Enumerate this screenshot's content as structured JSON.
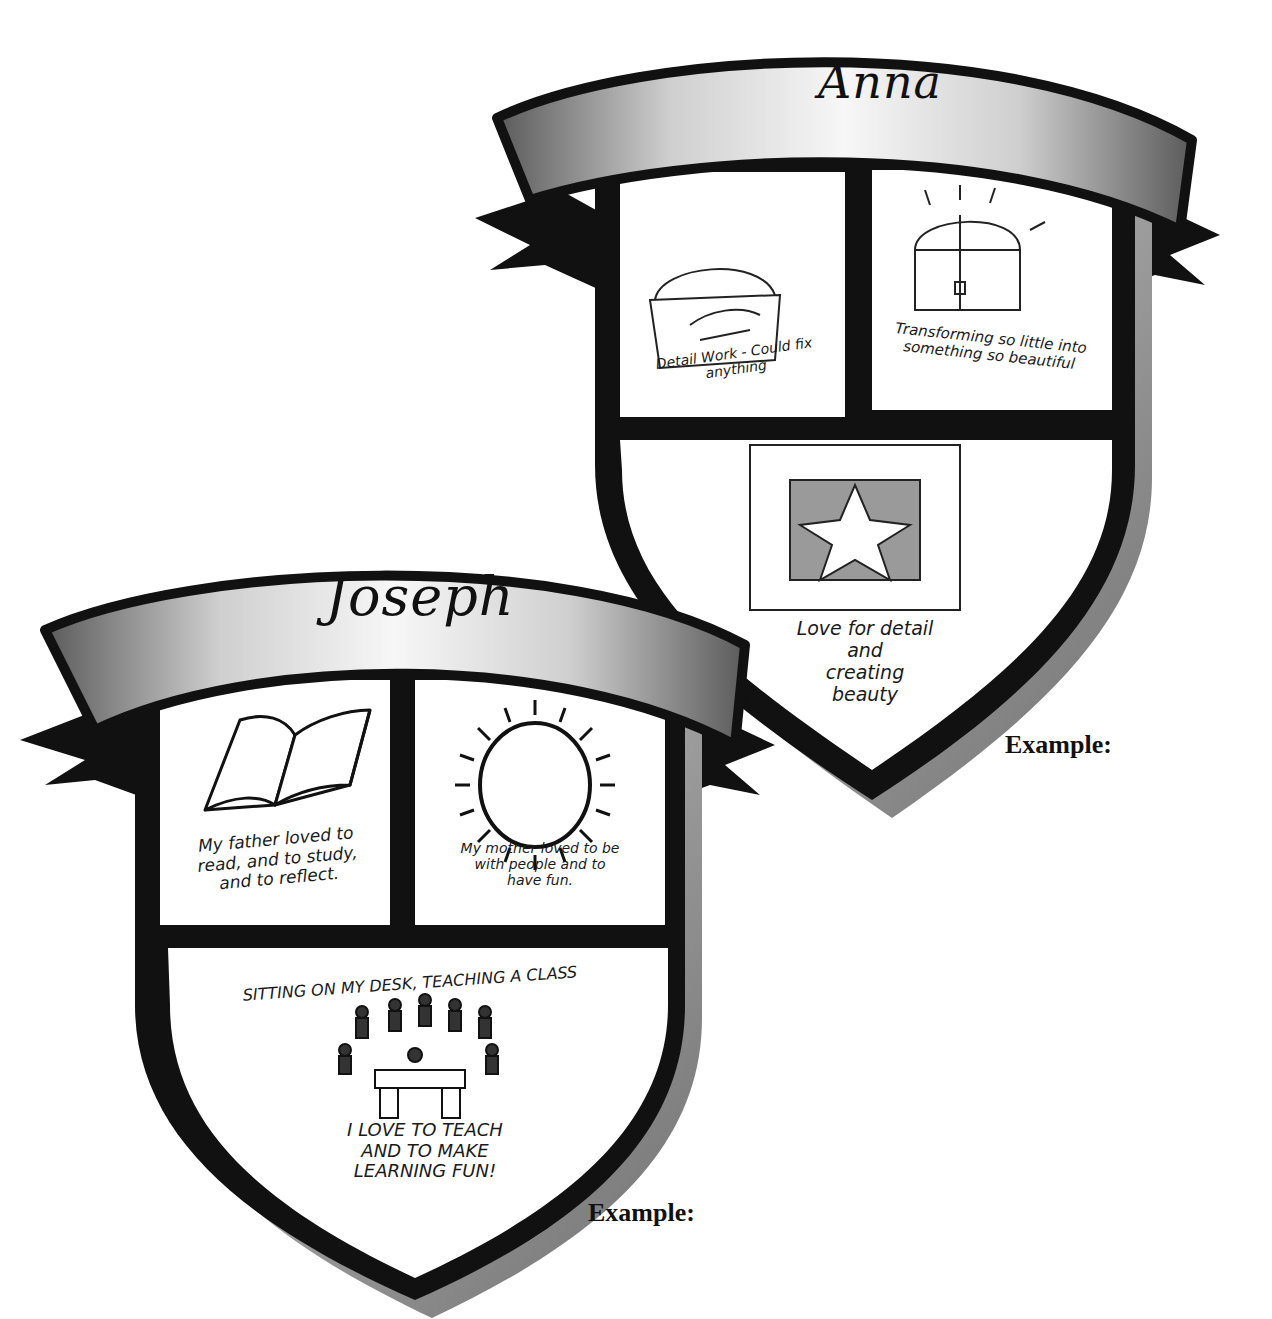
{
  "crests": {
    "anna": {
      "name": "Anna",
      "label": "Example:",
      "panels": {
        "top_left": {
          "icon": "toolbox-icon",
          "caption": "Detail Work - Could fix\nanything"
        },
        "top_right": {
          "icon": "treasure-chest-icon",
          "caption": "Transforming so little into\nsomething so beautiful"
        },
        "bottom": {
          "icon": "quilt-star-icon",
          "caption": "Love for detail\nand\ncreating\nbeauty"
        }
      }
    },
    "joseph": {
      "name": "Joseph",
      "label": "Example:",
      "panels": {
        "top_left": {
          "icon": "open-book-icon",
          "caption": "My father loved to\nread, and to study,\nand to reflect."
        },
        "top_right": {
          "icon": "sun-icon",
          "caption": "My mother loved to be\nwith people and to\nhave fun."
        },
        "bottom": {
          "icon": "classroom-icon",
          "heading": "SITTING ON MY DESK, TEACHING A CLASS",
          "caption": "I LOVE TO TEACH\nAND TO MAKE\nLEARNING FUN!"
        }
      }
    }
  },
  "colors": {
    "ink": "#111111",
    "shadow": "#8a8a8a",
    "banner_light": "#f2f2f2",
    "banner_dark": "#6e6e6e"
  }
}
